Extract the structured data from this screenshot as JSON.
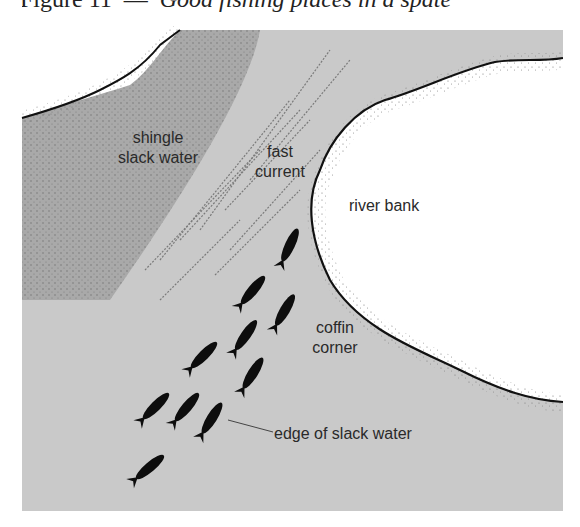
{
  "figure": {
    "title_prefix": "Figure 11",
    "title_rest": "Good fishing places in a spate",
    "labels": {
      "shingle": "shingle",
      "slack_water": "slack water",
      "fast": "fast",
      "current": "current",
      "river_bank": "river bank",
      "coffin": "coffin",
      "corner": "corner",
      "edge_of_slack_water": "edge of slack water"
    },
    "colors": {
      "water": "#c9c9c9",
      "shingle": "#a9a9a9",
      "bank": "#ffffff",
      "outline": "#111111",
      "fish": "#0d0d0d"
    },
    "fish_count": 11
  }
}
